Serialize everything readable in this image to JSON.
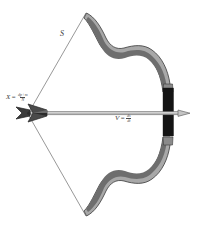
{
  "figure": {
    "type": "mechanics-diagram",
    "canvas": {
      "width": 197,
      "height": 230,
      "background": "#ffffff"
    }
  },
  "labels": {
    "string_label": "S",
    "draw_label": {
      "symbol": "X",
      "equals": "=",
      "numerator": "dp+m",
      "denominator": "N"
    },
    "velocity_label": {
      "symbol": "V",
      "equals": "=",
      "numerator": "ds",
      "denominator": "dt"
    }
  },
  "colors": {
    "limb_fill": "#6e6e6e",
    "limb_outline": "#a8a8a8",
    "limb_edge": "#3a3a3a",
    "grip_fill": "#141414",
    "grip_cap": "#8a8a8a",
    "shaft_fill": "#b9b9b9",
    "shaft_outline": "#6a6a6a",
    "fletching_fill": "#4a4a4a",
    "fletching_dark": "#2a2a2a",
    "string": "#8c8c8c",
    "text": "#3c3c3c",
    "background": "#ffffff"
  },
  "parts": {
    "upper_limb": "upper-limb",
    "lower_limb": "lower-limb",
    "riser": "bow-riser-grip",
    "string_upper": "bowstring-upper-segment",
    "string_lower": "bowstring-lower-segment",
    "arrow_shaft": "arrow-shaft",
    "arrow_tip": "arrow-tip",
    "arrow_fletching": "arrow-fletching",
    "nock_point": "nock-point"
  }
}
